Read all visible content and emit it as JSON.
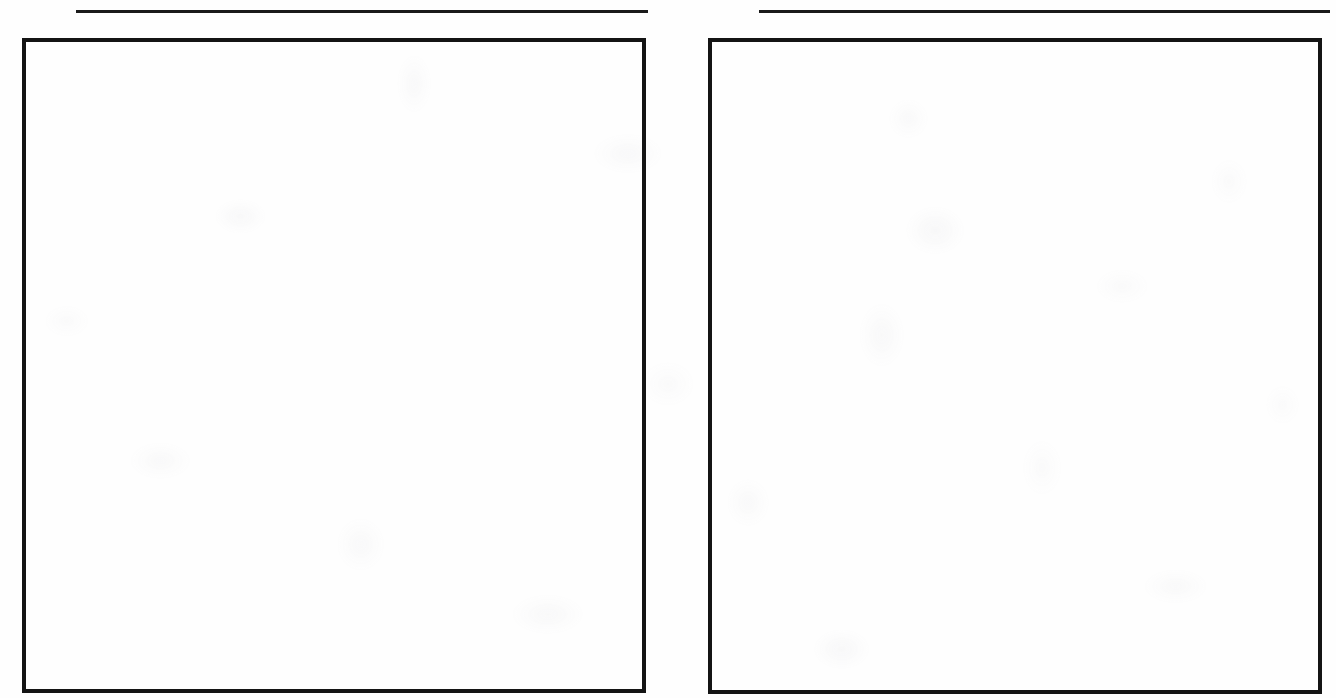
{
  "document": {
    "kind": "scanned-blank-form-page",
    "page_background_color": "#fefefe",
    "ink_color": "#141414",
    "width": 1336,
    "height": 698,
    "heading_rules": [
      {
        "name": "left-heading-rule",
        "x": 76,
        "y": 10,
        "width": 572,
        "thickness": 3,
        "color": "#1a1a1a"
      },
      {
        "name": "right-heading-rule",
        "x": 759,
        "y": 10,
        "width": 571,
        "thickness": 3,
        "color": "#1a1a1a"
      }
    ],
    "panels": [
      {
        "name": "left-panel",
        "content": "",
        "x": 22,
        "y": 38,
        "width": 624,
        "height": 655,
        "border_width": 4,
        "border_color": "#141414",
        "fill": "blank"
      },
      {
        "name": "right-panel",
        "content": "",
        "x": 708,
        "y": 38,
        "width": 614,
        "height": 656,
        "border_width": 4,
        "border_color": "#141414",
        "fill": "blank"
      }
    ]
  }
}
